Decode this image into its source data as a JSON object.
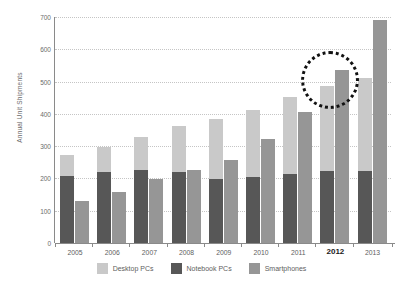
{
  "chart_data": {
    "type": "bar",
    "title": "",
    "subtitle": "",
    "xlabel": "",
    "ylabel": "Annual Unit Shipments",
    "ylim": [
      0,
      700
    ],
    "yticks": [
      0,
      100,
      200,
      300,
      400,
      500,
      600,
      700
    ],
    "ytick_labels": [
      "0",
      "100",
      "200",
      "300",
      "400",
      "500",
      "600",
      "700"
    ],
    "grid": true,
    "grid_style": "dotted",
    "legend_position": "bottom-center",
    "categories": [
      "2005",
      "2006",
      "2007",
      "2008",
      "2009",
      "2010",
      "2011",
      "2012",
      "2013"
    ],
    "highlighted_category": "2012",
    "annotations": [
      {
        "name": "highlight-circle",
        "shape": "dotted-circle",
        "target": "2012",
        "description": "Dotted circle highlighting the 2012 crossover where Smartphones overtake combined PCs"
      }
    ],
    "series": [
      {
        "name": "Desktop PCs",
        "color": "#c9c9c9",
        "stacked_with": "Notebook PCs",
        "values": [
          63,
          77,
          101,
          142,
          186,
          207,
          237,
          263,
          288
        ]
      },
      {
        "name": "Notebook PCs",
        "color": "#575757",
        "stacked_with": "Desktop PCs",
        "values": [
          209,
          219,
          226,
          220,
          197,
          205,
          215,
          222,
          222
        ]
      },
      {
        "name": "Smartphones",
        "color": "#969696",
        "stacked_with": null,
        "values": [
          131,
          157,
          197,
          226,
          257,
          322,
          405,
          535,
          690
        ]
      }
    ],
    "stack_totals_pc": [
      272,
      296,
      327,
      362,
      383,
      412,
      452,
      485,
      510
    ]
  }
}
